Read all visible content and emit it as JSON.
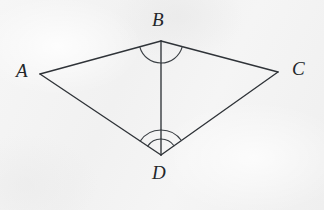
{
  "figure": {
    "kind": "geometry-diagram",
    "background_color": "#f4f4f4",
    "line_color": "#2f3338",
    "label_color": "#23262a",
    "canvas": {
      "width": 324,
      "height": 210
    },
    "vertices": [
      {
        "id": "A",
        "label": "A",
        "x": 40,
        "y": 74,
        "label_x": 16,
        "label_y": 61
      },
      {
        "id": "B",
        "label": "B",
        "x": 161,
        "y": 41,
        "label_x": 152,
        "label_y": 10
      },
      {
        "id": "C",
        "label": "C",
        "x": 278,
        "y": 72,
        "label_x": 292,
        "label_y": 59
      },
      {
        "id": "D",
        "label": "D",
        "x": 161,
        "y": 155,
        "label_x": 152,
        "label_y": 163
      }
    ],
    "segments": [
      {
        "id": "AB",
        "from": "A",
        "to": "B",
        "role": "edge"
      },
      {
        "id": "BC",
        "from": "B",
        "to": "C",
        "role": "edge"
      },
      {
        "id": "CD",
        "from": "C",
        "to": "D",
        "role": "edge"
      },
      {
        "id": "DA",
        "from": "D",
        "to": "A",
        "role": "edge"
      },
      {
        "id": "BD",
        "from": "B",
        "to": "D",
        "role": "diagonal"
      }
    ],
    "angle_marks": [
      {
        "id": "angle-ABD",
        "vertex": "B",
        "rays": [
          "A",
          "D"
        ],
        "arcs": 1,
        "radii": [
          22
        ]
      },
      {
        "id": "angle-CBD",
        "vertex": "B",
        "rays": [
          "D",
          "C"
        ],
        "arcs": 1,
        "radii": [
          22
        ]
      },
      {
        "id": "angle-ADB",
        "vertex": "D",
        "rays": [
          "B",
          "A"
        ],
        "arcs": 2,
        "radii": [
          16,
          25
        ]
      },
      {
        "id": "angle-CDB",
        "vertex": "D",
        "rays": [
          "C",
          "B"
        ],
        "arcs": 2,
        "radii": [
          16,
          25
        ]
      }
    ]
  }
}
